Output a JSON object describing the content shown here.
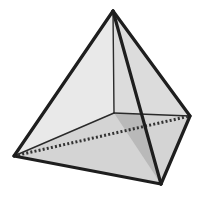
{
  "diagram": {
    "type": "3d-solid",
    "shape": "square-pyramid",
    "vertices": {
      "apex": [
        113,
        11
      ],
      "left": [
        14,
        156
      ],
      "front": [
        161,
        184
      ],
      "right": [
        190,
        116
      ],
      "back": [
        114,
        113
      ]
    },
    "faces": [
      {
        "name": "left-face",
        "points": [
          "apex",
          "left",
          "front"
        ],
        "fill": "#e9e9e9"
      },
      {
        "name": "right-face",
        "points": [
          "apex",
          "front",
          "right"
        ],
        "fill": "#e4e4e4"
      },
      {
        "name": "base-front",
        "points": [
          "left",
          "front",
          "right",
          "back"
        ],
        "fill": "#d4d4d4"
      },
      {
        "name": "inner-shaded-face",
        "points": [
          "apex",
          "back",
          "front"
        ],
        "fill": "#b9b9b9"
      },
      {
        "name": "back-right-face",
        "points": [
          "apex",
          "back",
          "right"
        ],
        "fill": "#dcdcdc"
      }
    ],
    "edges": {
      "visible_thick": [
        [
          "apex",
          "left"
        ],
        [
          "apex",
          "front"
        ],
        [
          "apex",
          "right"
        ],
        [
          "left",
          "front"
        ],
        [
          "front",
          "right"
        ]
      ],
      "visible_thin": [
        [
          "apex",
          "back"
        ],
        [
          "back",
          "left"
        ],
        [
          "back",
          "right"
        ]
      ],
      "hidden_dotted": [
        [
          "left",
          "right"
        ]
      ]
    },
    "colors": {
      "outline": "#1e1e1e",
      "background": "#ffffff"
    }
  }
}
